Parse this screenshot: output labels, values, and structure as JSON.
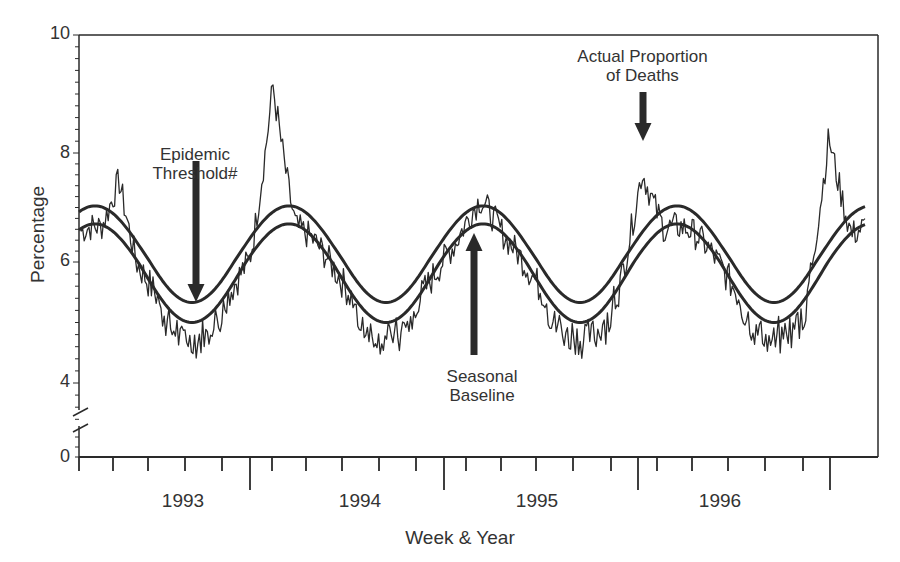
{
  "chart_data": {
    "type": "line",
    "title": "",
    "xlabel": "Week & Year",
    "ylabel": "Percentage",
    "ylim": [
      0,
      10
    ],
    "y_axis_break": [
      0,
      4
    ],
    "y_ticks": [
      "10",
      "8",
      "6",
      "4",
      "0"
    ],
    "x_tick_labels": [
      "1993",
      "1994",
      "1995",
      "1996"
    ],
    "grid": false,
    "annotations": [
      {
        "text": "Epidemic Threshold#",
        "line1": "Epidemic",
        "line2": "Threshold#",
        "arrow": "down"
      },
      {
        "text": "Seasonal Baseline",
        "line1": "Seasonal",
        "line2": "Baseline",
        "arrow": "up"
      },
      {
        "text": "Actual Proportion of Deaths",
        "line1": "Actual Proportion",
        "line2": "of Deaths",
        "arrow": "down"
      }
    ],
    "series": [
      {
        "name": "Epidemic Threshold",
        "description": "sinusoid, peaks ~7.0 in winter, troughs ~5.3 in summer"
      },
      {
        "name": "Seasonal Baseline",
        "description": "sinusoid, peaks ~6.7 in winter, troughs ~5.0 in summer"
      },
      {
        "name": "Actual Proportion of Deaths",
        "description": "weekly observed percentage",
        "peaks": [
          {
            "season": "1992-93",
            "value": 7.7
          },
          {
            "season": "1993-94",
            "value": 9.2
          },
          {
            "season": "1994-95",
            "value": 7.4
          },
          {
            "season": "1995-96",
            "value": 8.1
          },
          {
            "season": "1996-97",
            "value": 9.1
          }
        ],
        "troughs": [
          {
            "season": "summer 1993",
            "value": 4.7
          },
          {
            "season": "summer 1994",
            "value": 4.9
          },
          {
            "season": "summer 1995",
            "value": 4.8
          },
          {
            "season": "summer 1996",
            "value": 4.8
          }
        ]
      }
    ]
  }
}
